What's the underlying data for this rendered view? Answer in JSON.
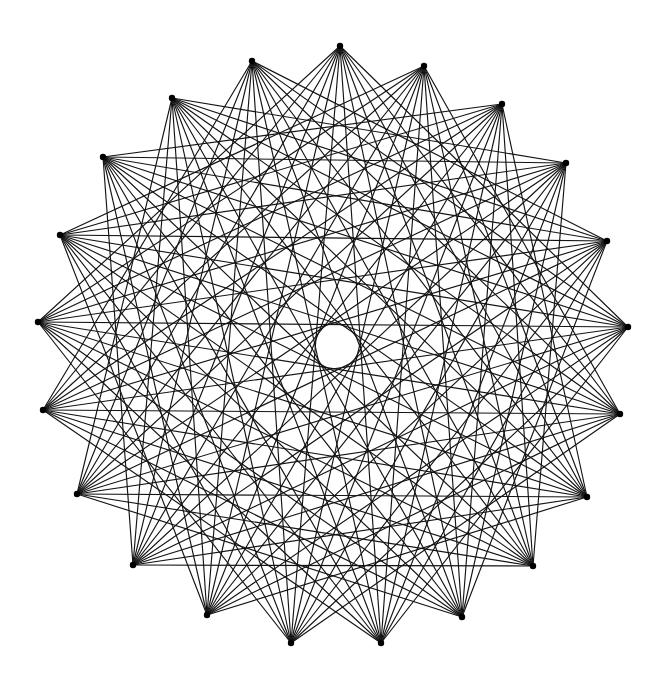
{
  "figure": {
    "stroke_color": "#141414",
    "background_color": "#ffffff",
    "center_hole": {
      "cx": 340,
      "cy": 345,
      "r": 23
    },
    "vertices": [
      [
        424,
        66
      ],
      [
        502,
        104
      ],
      [
        566,
        163
      ],
      [
        607,
        241
      ],
      [
        628,
        327
      ],
      [
        620,
        414
      ],
      [
        587,
        497
      ],
      [
        533,
        566
      ],
      [
        462,
        617
      ],
      [
        381,
        643
      ],
      [
        291,
        643
      ],
      [
        207,
        615
      ],
      [
        133,
        565
      ],
      [
        77,
        494
      ],
      [
        43,
        410
      ],
      [
        38,
        322
      ],
      [
        60,
        235
      ],
      [
        103,
        157
      ],
      [
        172,
        98
      ],
      [
        252,
        61
      ],
      [
        340,
        46
      ]
    ],
    "connection_offsets": [
      5,
      6,
      7,
      8,
      9,
      10
    ]
  }
}
